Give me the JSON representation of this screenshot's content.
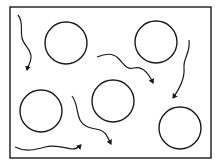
{
  "diagram": {
    "colors": {
      "stroke": "#1a1a1a",
      "background": "#ffffff"
    },
    "frame": {
      "x": 10,
      "y": 7,
      "width": 201,
      "height": 151
    },
    "circles": [
      {
        "cx": 66,
        "cy": 43,
        "r": 21
      },
      {
        "cx": 156,
        "cy": 42,
        "r": 21
      },
      {
        "cx": 41,
        "cy": 111,
        "r": 21
      },
      {
        "cx": 113,
        "cy": 101,
        "r": 21
      },
      {
        "cx": 180,
        "cy": 128,
        "r": 21
      }
    ],
    "paths": [
      {
        "d": "M18,15 C24,22 20,30 22,38 C24,46 32,50 31,58 C30,64 28,66 27,70",
        "arrow_end": [
          27,
          70
        ],
        "arrow_dir": "down"
      },
      {
        "d": "M97,57 C104,54 112,52 118,58 C124,64 126,70 134,68 C142,66 148,72 153,83",
        "arrow_end": [
          153,
          83
        ],
        "arrow_dir": "down-right"
      },
      {
        "d": "M189,40 C191,52 183,58 184,68 C185,78 180,88 173,98",
        "arrow_end": [
          173,
          98
        ],
        "arrow_dir": "down-left"
      },
      {
        "d": "M72,96 C78,104 76,112 80,120 C84,128 92,128 100,130 C106,132 108,138 111,144",
        "arrow_end": [
          111,
          144
        ],
        "arrow_dir": "down"
      },
      {
        "d": "M15,147 C25,152 35,150 45,147 C55,144 65,148 72,149 C76,149 79,147 81,145",
        "arrow_end": [
          81,
          145
        ],
        "arrow_dir": "right"
      }
    ]
  }
}
